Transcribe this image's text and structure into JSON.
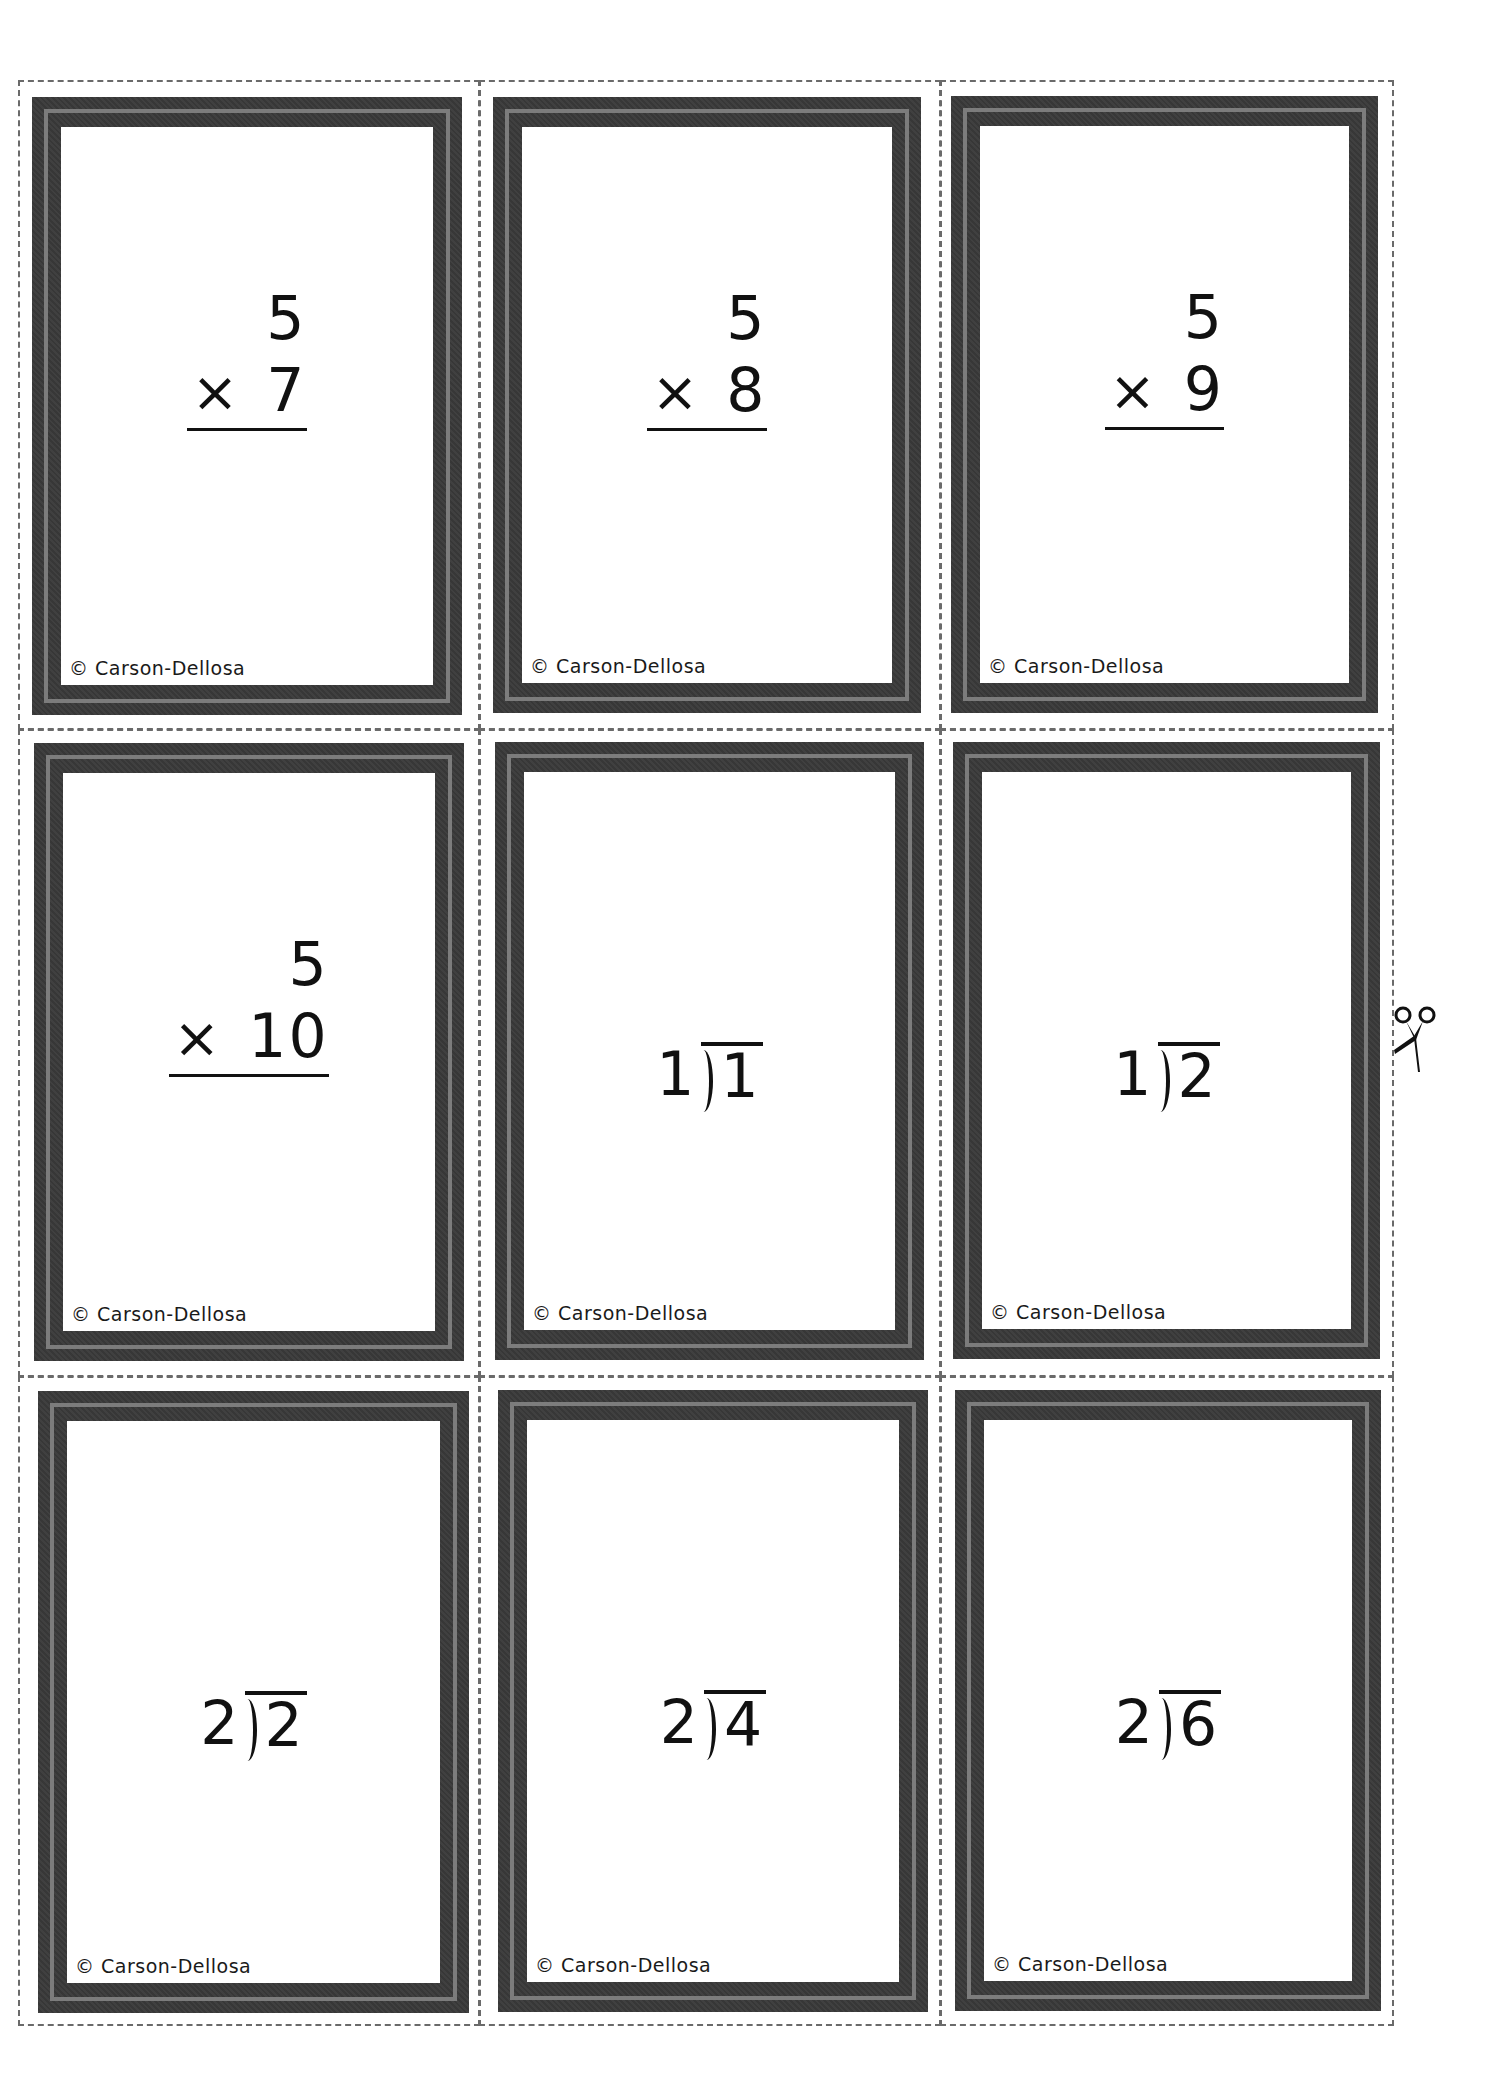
{
  "sheet": {
    "border_color": "#6a6a6a",
    "frame_color": "#3a3a3a",
    "frame_stripe_color": "#7c7c7c",
    "cut_icon": "scissors-icon"
  },
  "cards": [
    {
      "type": "multiplication",
      "top": "5",
      "operator": "×",
      "bottom": "7",
      "copyright": "© Carson-Dellosa"
    },
    {
      "type": "multiplication",
      "top": "5",
      "operator": "×",
      "bottom": "8",
      "copyright": "© Carson-Dellosa"
    },
    {
      "type": "multiplication",
      "top": "5",
      "operator": "×",
      "bottom": "9",
      "copyright": "© Carson-Dellosa"
    },
    {
      "type": "multiplication",
      "top": "5",
      "operator": "×",
      "bottom": "10",
      "copyright": "© Carson-Dellosa"
    },
    {
      "type": "division",
      "divisor": "1",
      "dividend": "1",
      "copyright": "© Carson-Dellosa"
    },
    {
      "type": "division",
      "divisor": "1",
      "dividend": "2",
      "copyright": "© Carson-Dellosa"
    },
    {
      "type": "division",
      "divisor": "2",
      "dividend": "2",
      "copyright": "© Carson-Dellosa"
    },
    {
      "type": "division",
      "divisor": "2",
      "dividend": "4",
      "copyright": "© Carson-Dellosa"
    },
    {
      "type": "division",
      "divisor": "2",
      "dividend": "6",
      "copyright": "© Carson-Dellosa"
    }
  ]
}
